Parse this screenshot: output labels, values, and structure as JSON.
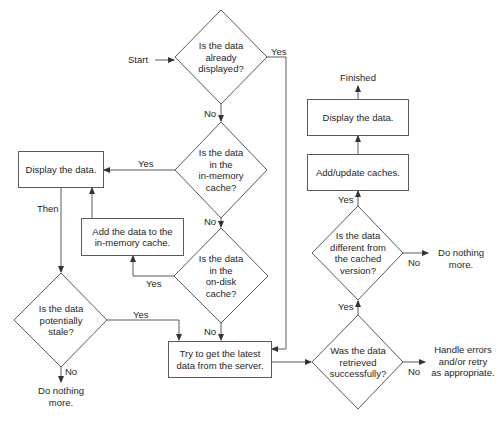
{
  "diagram": {
    "type": "flowchart",
    "colors": {
      "line": "#5a5a5a",
      "text": "#262626",
      "background": "#ffffff"
    },
    "start_label": "Start",
    "nodes": {
      "q_displayed": {
        "shape": "diamond",
        "text": "Is the data\nalready\ndisplayed?"
      },
      "q_memory": {
        "shape": "diamond",
        "text": "Is the data\nin the\nin-memory\ncache?"
      },
      "q_disk": {
        "shape": "diamond",
        "text": "Is the data\nin the\non-disk\ncache?"
      },
      "display_left": {
        "shape": "box",
        "text": "Display the data."
      },
      "add_memory": {
        "shape": "box",
        "text": "Add the data to the\nin-memory cache."
      },
      "q_stale": {
        "shape": "diamond",
        "text": "Is the data\npotentially\nstale?"
      },
      "stop_stale": {
        "shape": "terminal",
        "text": "Do nothing\nmore."
      },
      "fetch_server": {
        "shape": "box",
        "text": "Try to get the latest\ndata from the server."
      },
      "q_retrieved": {
        "shape": "diamond",
        "text": "Was the data\nretrieved\nsuccessfully?"
      },
      "handle_errors": {
        "shape": "terminal",
        "text": "Handle errors\nand/or retry\nas appropriate."
      },
      "q_different": {
        "shape": "diamond",
        "text": "Is the data\ndifferent from\nthe cached\nversion?"
      },
      "stop_same": {
        "shape": "terminal",
        "text": "Do nothing\nmore."
      },
      "update_caches": {
        "shape": "box",
        "text": "Add/update caches."
      },
      "display_right": {
        "shape": "box",
        "text": "Display the data."
      },
      "finished": {
        "shape": "terminal",
        "text": "Finished"
      }
    },
    "edge_labels": {
      "displayed_yes": "Yes",
      "displayed_no": "No",
      "memory_yes": "Yes",
      "memory_no": "No",
      "disk_yes": "Yes",
      "disk_no": "No",
      "then": "Then",
      "stale_yes": "Yes",
      "stale_no": "No",
      "retrieved_yes": "Yes",
      "retrieved_no": "No",
      "different_yes": "Yes",
      "different_no": "No"
    }
  }
}
